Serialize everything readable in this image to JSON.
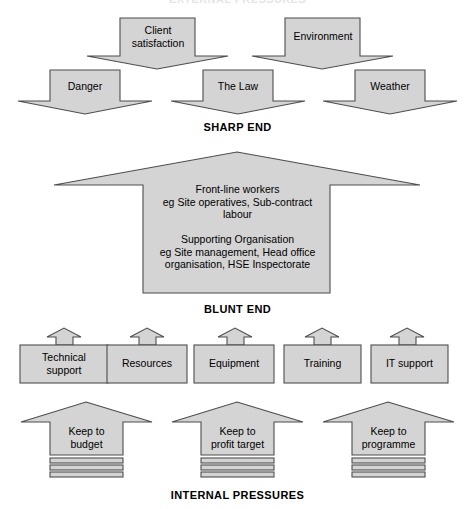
{
  "figure": {
    "title_top": "EXTERNAL PRESSURES",
    "title_bottom": "INTERNAL PRESSURES",
    "label_sharp_end": "SHARP END",
    "label_blunt_end": "BLUNT END"
  },
  "colors": {
    "shape_fill": "#d4d4d4",
    "shape_stroke": "#4d4d4d",
    "text": "#000000",
    "background": "#ffffff"
  },
  "external_pressures": {
    "row_upper": [
      {
        "label_line1": "Client",
        "label_line2": "satisfaction"
      },
      {
        "label_line1": "Environment",
        "label_line2": ""
      }
    ],
    "row_lower": [
      {
        "label_line1": "Danger",
        "label_line2": ""
      },
      {
        "label_line1": "The Law",
        "label_line2": ""
      },
      {
        "label_line1": "Weather",
        "label_line2": ""
      }
    ]
  },
  "central_block": {
    "group_1_heading": "Front-line workers",
    "group_1_line1": "eg Site operatives, Sub-contract",
    "group_1_line2": "labour",
    "group_2_heading": "Supporting Organisation",
    "group_2_line1": "eg Site management, Head office",
    "group_2_line2": "organisation, HSE Inspectorate"
  },
  "support_boxes": [
    {
      "line1": "Technical",
      "line2": "support"
    },
    {
      "line1": "Resources",
      "line2": ""
    },
    {
      "line1": "Equipment",
      "line2": ""
    },
    {
      "line1": "Training",
      "line2": ""
    },
    {
      "line1": "IT support",
      "line2": ""
    }
  ],
  "internal_pressures": [
    {
      "line1": "Keep to",
      "line2": "budget"
    },
    {
      "line1": "Keep to",
      "line2": "profit target"
    },
    {
      "line1": "Keep to",
      "line2": "programme"
    }
  ]
}
